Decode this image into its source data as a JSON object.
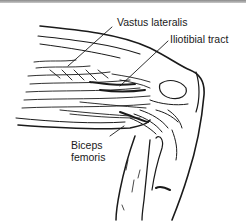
{
  "figure": {
    "colors": {
      "ink": "#1a1a1a",
      "background": "#ffffff",
      "top_rule": "#8a8a8a"
    },
    "labels": [
      {
        "id": "vastus",
        "text": "Vastus lateralis"
      },
      {
        "id": "itb",
        "text": "Iliotibial tract"
      },
      {
        "id": "biceps",
        "text": "Biceps femoris"
      }
    ]
  }
}
